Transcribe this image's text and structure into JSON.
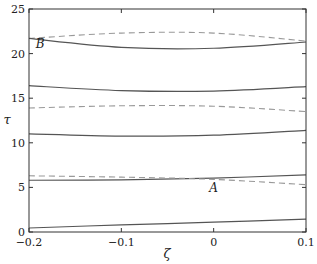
{
  "chart_data": {
    "type": "line",
    "title": "",
    "xlabel": "ζ",
    "ylabel": "τ",
    "xlim": [
      -0.2,
      0.1
    ],
    "ylim": [
      0,
      25
    ],
    "xticks": [
      -0.2,
      -0.1,
      0,
      0.1
    ],
    "xtick_labels": [
      "−0.2",
      "−0.1",
      "0",
      "0.1"
    ],
    "yticks": [
      0,
      5,
      10,
      15,
      20,
      25
    ],
    "ytick_labels": [
      "0",
      "5",
      "10",
      "15",
      "20",
      "25"
    ],
    "grid": false,
    "legend": null,
    "series": [
      {
        "name": "solid-1",
        "style": "solid",
        "x": [
          -0.2,
          -0.1,
          0,
          0.1
        ],
        "y": [
          0.45,
          0.8,
          1.1,
          1.45
        ]
      },
      {
        "name": "solid-2",
        "style": "solid",
        "x": [
          -0.2,
          -0.1,
          0,
          0.1
        ],
        "y": [
          5.8,
          5.85,
          6.05,
          6.4
        ]
      },
      {
        "name": "dashed-1",
        "style": "dashed",
        "x": [
          -0.2,
          -0.1,
          0,
          0.1
        ],
        "y": [
          6.3,
          6.15,
          5.9,
          5.3
        ]
      },
      {
        "name": "solid-3",
        "style": "solid",
        "x": [
          -0.2,
          -0.1,
          0,
          0.1
        ],
        "y": [
          11.0,
          10.75,
          10.85,
          11.4
        ]
      },
      {
        "name": "dashed-2",
        "style": "dashed",
        "x": [
          -0.2,
          -0.1,
          0,
          0.1
        ],
        "y": [
          13.9,
          14.15,
          14.1,
          13.5
        ]
      },
      {
        "name": "solid-4",
        "style": "solid",
        "x": [
          -0.2,
          -0.1,
          0,
          0.1
        ],
        "y": [
          16.4,
          15.85,
          15.8,
          16.3
        ]
      },
      {
        "name": "dashed-3",
        "style": "dashed",
        "x": [
          -0.2,
          -0.1,
          0,
          0.1
        ],
        "y": [
          21.7,
          22.3,
          22.3,
          21.4
        ]
      },
      {
        "name": "solid-5",
        "style": "solid",
        "x": [
          -0.2,
          -0.1,
          0,
          0.1
        ],
        "y": [
          21.7,
          20.7,
          20.6,
          21.3
        ]
      }
    ],
    "annotations": [
      {
        "text": "A",
        "x": 0.0,
        "y": 4.5
      },
      {
        "text": "B",
        "x": -0.188,
        "y": 20.6
      }
    ]
  },
  "colors": {
    "solid": "#555555",
    "dashed": "#999999",
    "axis": "#333333"
  }
}
